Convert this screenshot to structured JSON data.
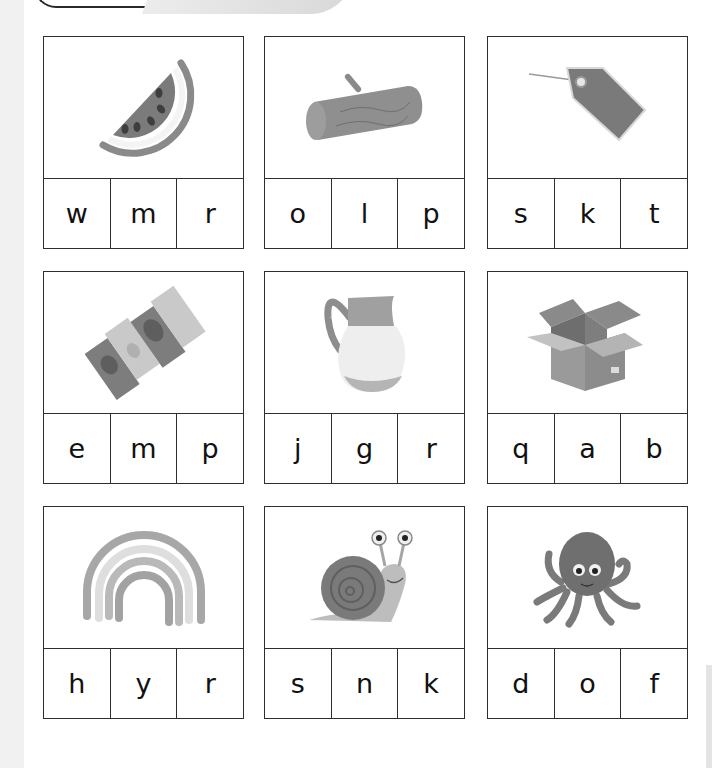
{
  "worksheet": {
    "cards": [
      {
        "picture": "watermelon-icon",
        "letters": [
          "w",
          "m",
          "r"
        ]
      },
      {
        "picture": "log-icon",
        "letters": [
          "o",
          "l",
          "p"
        ]
      },
      {
        "picture": "tag-icon",
        "letters": [
          "s",
          "k",
          "t"
        ]
      },
      {
        "picture": "map-icon",
        "letters": [
          "e",
          "m",
          "p"
        ]
      },
      {
        "picture": "jug-icon",
        "letters": [
          "j",
          "g",
          "r"
        ]
      },
      {
        "picture": "box-icon",
        "letters": [
          "q",
          "a",
          "b"
        ]
      },
      {
        "picture": "rainbow-icon",
        "letters": [
          "h",
          "y",
          "r"
        ]
      },
      {
        "picture": "snail-icon",
        "letters": [
          "s",
          "n",
          "k"
        ]
      },
      {
        "picture": "octopus-icon",
        "letters": [
          "d",
          "o",
          "f"
        ]
      }
    ]
  },
  "colors": {
    "border": "#2e2e2e",
    "background": "#ffffff"
  }
}
